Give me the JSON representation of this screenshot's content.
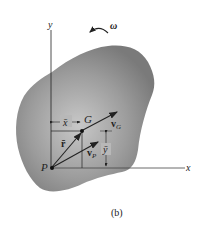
{
  "figure": {
    "caption": "(b)",
    "axes": {
      "x_label": "x",
      "y_label": "y"
    },
    "angular_velocity_label": "ω",
    "points": {
      "P": "P",
      "G": "G"
    },
    "vectors": {
      "v_G": "v",
      "v_G_sub": "G",
      "v_P": "v",
      "v_P_sub": "P",
      "r_bar": "r̄"
    },
    "dimensions": {
      "x_bar": "x̄",
      "y_bar": "ȳ"
    },
    "colors": {
      "body": "#8a8a8a",
      "body_edge": "#a8a8a8",
      "lines": "#222222",
      "background": "#ffffff"
    }
  }
}
